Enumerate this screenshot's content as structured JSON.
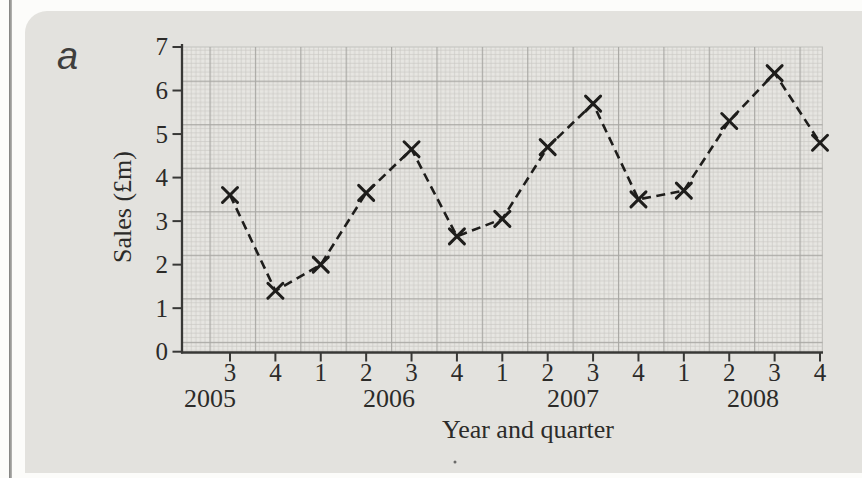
{
  "part_label": "a",
  "chart_data": {
    "type": "line",
    "title": "",
    "xlabel": "Year and quarter",
    "ylabel": "Sales (£m)",
    "ylim": [
      0,
      7
    ],
    "y_ticks": [
      "0",
      "1",
      "2",
      "3",
      "4",
      "5",
      "6",
      "7"
    ],
    "x_axis": {
      "quarter_tick_labels": [
        "3",
        "4",
        "1",
        "2",
        "3",
        "4",
        "1",
        "2",
        "3",
        "4",
        "1",
        "2",
        "3",
        "4"
      ],
      "year_labels": [
        "2005",
        "2006",
        "2007",
        "2008"
      ]
    },
    "categories": [
      "2005 Q3",
      "2005 Q4",
      "2006 Q1",
      "2006 Q2",
      "2006 Q3",
      "2006 Q4",
      "2007 Q1",
      "2007 Q2",
      "2007 Q3",
      "2007 Q4",
      "2008 Q1",
      "2008 Q2",
      "2008 Q3",
      "2008 Q4"
    ],
    "series": [
      {
        "name": "Sales (£m)",
        "values": [
          3.6,
          1.4,
          2.0,
          3.65,
          4.65,
          2.65,
          3.05,
          4.7,
          5.7,
          3.5,
          3.7,
          5.3,
          6.4,
          4.8
        ],
        "line_style": "dashed",
        "marker": "x",
        "color": "#1e1d1b"
      }
    ],
    "grid": "graph-paper, 10 minor divisions per major unit",
    "legend_position": "none"
  },
  "colors": {
    "page_bg": "#fcfcfa",
    "card_bg": "#e3e2de",
    "paper_bg": "#e7e6e2",
    "grid_minor": "#c9c8c4",
    "grid_major": "#a9a8a4",
    "axis": "#383836",
    "series_line": "#1e1d1b",
    "text": "#2c2b29"
  }
}
